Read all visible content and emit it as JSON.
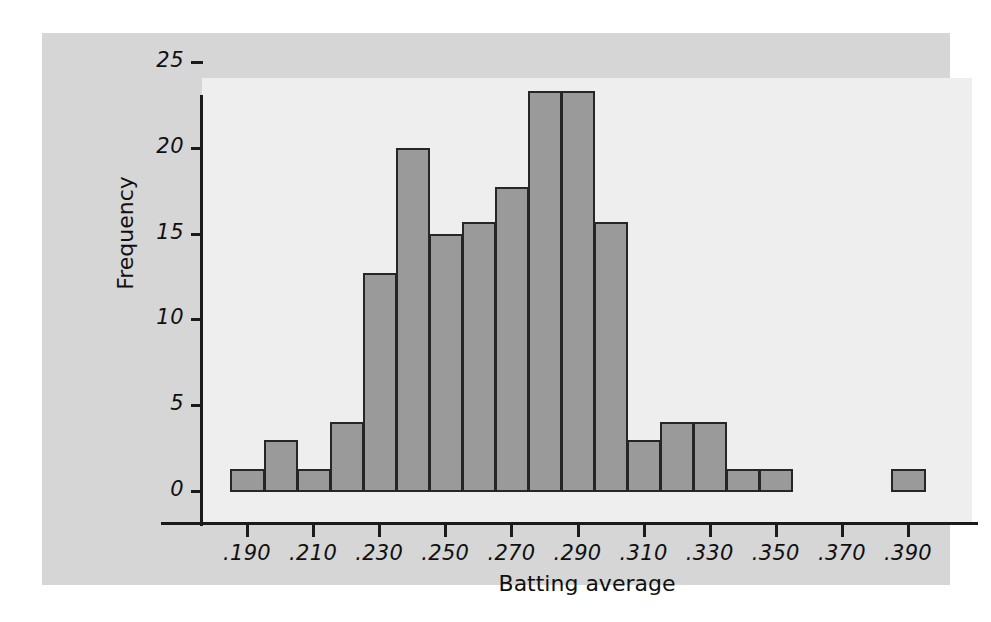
{
  "figure": {
    "panel_bg": "#d6d6d6",
    "plot_bg": "#eeeeee",
    "bar_fill": "#9a9a9a",
    "bar_stroke": "#262626",
    "axis_color": "#1b1b1b"
  },
  "chart_data": {
    "type": "bar",
    "title": "",
    "subtitle": "",
    "xlabel": "Batting average",
    "ylabel": "Frequency",
    "grid": false,
    "legend": null,
    "xlim": [
      0.18,
      0.395
    ],
    "ylim": [
      0,
      25
    ],
    "bin_width": 0.01,
    "xticks": [
      ".190",
      ".210",
      ".230",
      ".250",
      ".270",
      ".290",
      ".310",
      ".330",
      ".350",
      ".370",
      ".390"
    ],
    "xtick_values": [
      0.19,
      0.21,
      0.23,
      0.25,
      0.27,
      0.29,
      0.31,
      0.33,
      0.35,
      0.37,
      0.39
    ],
    "yticks": [
      "0",
      "5",
      "10",
      "15",
      "20",
      "25"
    ],
    "ytick_values": [
      0,
      5,
      10,
      15,
      20,
      25
    ],
    "bins": [
      {
        "left": 0.185,
        "right": 0.195,
        "center": 0.19,
        "value": 1.3
      },
      {
        "left": 0.195,
        "right": 0.205,
        "center": 0.2,
        "value": 3.0
      },
      {
        "left": 0.205,
        "right": 0.215,
        "center": 0.21,
        "value": 1.3
      },
      {
        "left": 0.215,
        "right": 0.225,
        "center": 0.22,
        "value": 4.0
      },
      {
        "left": 0.225,
        "right": 0.235,
        "center": 0.23,
        "value": 12.7
      },
      {
        "left": 0.235,
        "right": 0.245,
        "center": 0.24,
        "value": 20.0
      },
      {
        "left": 0.245,
        "right": 0.255,
        "center": 0.25,
        "value": 15.0
      },
      {
        "left": 0.255,
        "right": 0.265,
        "center": 0.26,
        "value": 15.7
      },
      {
        "left": 0.265,
        "right": 0.275,
        "center": 0.27,
        "value": 17.7
      },
      {
        "left": 0.275,
        "right": 0.285,
        "center": 0.28,
        "value": 23.3
      },
      {
        "left": 0.285,
        "right": 0.295,
        "center": 0.29,
        "value": 23.3
      },
      {
        "left": 0.295,
        "right": 0.305,
        "center": 0.3,
        "value": 15.7
      },
      {
        "left": 0.305,
        "right": 0.315,
        "center": 0.31,
        "value": 3.0
      },
      {
        "left": 0.315,
        "right": 0.325,
        "center": 0.32,
        "value": 4.0
      },
      {
        "left": 0.325,
        "right": 0.335,
        "center": 0.33,
        "value": 4.0
      },
      {
        "left": 0.335,
        "right": 0.345,
        "center": 0.34,
        "value": 1.3
      },
      {
        "left": 0.345,
        "right": 0.355,
        "center": 0.35,
        "value": 1.3
      },
      {
        "left": 0.355,
        "right": 0.365,
        "center": 0.36,
        "value": 0
      },
      {
        "left": 0.365,
        "right": 0.375,
        "center": 0.37,
        "value": 0
      },
      {
        "left": 0.375,
        "right": 0.385,
        "center": 0.38,
        "value": 0
      },
      {
        "left": 0.385,
        "right": 0.395,
        "center": 0.39,
        "value": 1.3
      }
    ],
    "categories": [
      ".190",
      ".200",
      ".210",
      ".220",
      ".230",
      ".240",
      ".250",
      ".260",
      ".270",
      ".280",
      ".290",
      ".300",
      ".310",
      ".320",
      ".330",
      ".340",
      ".350",
      ".360",
      ".370",
      ".380",
      ".390"
    ],
    "values": [
      1.3,
      3.0,
      1.3,
      4.0,
      12.7,
      20.0,
      15.0,
      15.7,
      17.7,
      23.3,
      23.3,
      15.7,
      3.0,
      4.0,
      4.0,
      1.3,
      1.3,
      0,
      0,
      0,
      1.3
    ]
  }
}
